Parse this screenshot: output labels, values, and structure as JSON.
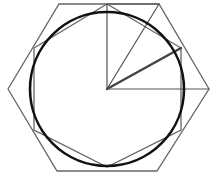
{
  "diagram": {
    "title": "",
    "colors": {
      "background": "#ffffff",
      "circle": "#111111",
      "hexagon": "#666666",
      "inscribed_polygon": "#666666",
      "radial_thin": "#555555",
      "radial_thick": "#444444"
    },
    "center": [
      107,
      89
    ],
    "circle": {
      "cx": 107,
      "cy": 89,
      "r": 77,
      "stroke_width": 2.6
    },
    "hexagon": {
      "points": [
        [
          8,
          89
        ],
        [
          59,
          4
        ],
        [
          159,
          4
        ],
        [
          209,
          89
        ],
        [
          157,
          171
        ],
        [
          57,
          171
        ]
      ],
      "stroke_width": 1.3
    },
    "inscribed_polygon": {
      "points": [
        [
          34,
          48
        ],
        [
          107,
          4
        ],
        [
          181,
          48
        ],
        [
          181,
          130
        ],
        [
          107,
          167
        ],
        [
          34,
          130
        ]
      ],
      "stroke_width": 1.3,
      "extra_edges": [
        [
          [
            107,
            4
          ],
          [
            107,
            4
          ]
        ],
        [
          [
            34,
            48
          ],
          [
            34,
            130
          ]
        ],
        [
          [
            181,
            48
          ],
          [
            181,
            130
          ]
        ]
      ]
    },
    "top_edge": {
      "from": [
        107,
        4
      ],
      "to": [
        159,
        4
      ]
    },
    "radials": [
      {
        "name": "radius-to-top",
        "to": [
          107,
          4
        ],
        "stroke_width": 1.2
      },
      {
        "name": "radius-to-hex-vertex",
        "to": [
          159,
          4
        ],
        "stroke_width": 1.2
      },
      {
        "name": "radius-to-tangent",
        "to": [
          181,
          48
        ],
        "stroke_width": 2.4
      },
      {
        "name": "radius-to-right",
        "to": [
          209,
          89
        ],
        "stroke_width": 1.2
      }
    ]
  }
}
